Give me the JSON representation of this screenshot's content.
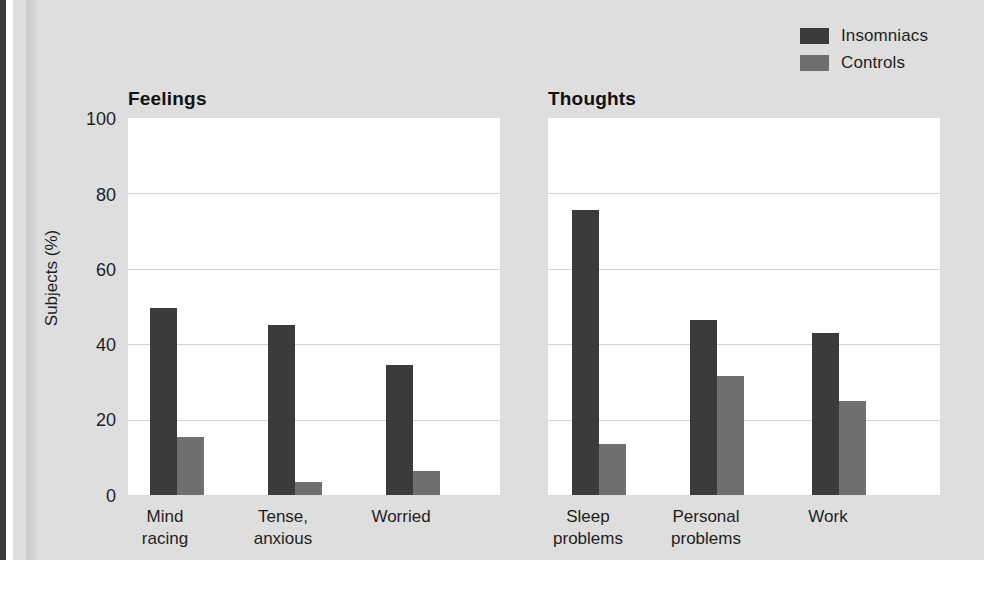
{
  "chart_data": {
    "type": "bar",
    "title": "",
    "xlabel": "",
    "ylabel": "Subjects (%)",
    "ylim": [
      0,
      100
    ],
    "yticks": [
      "0",
      "20",
      "40",
      "60",
      "80",
      "100"
    ],
    "grid": "horizontal",
    "legend_position": "top-right",
    "legend": [
      "Insomniacs",
      "Controls"
    ],
    "panels": [
      {
        "title": "Feelings",
        "categories": [
          "Mind\nracing",
          "Tense,\nanxious",
          "Worried"
        ],
        "series": [
          {
            "name": "Insomniacs",
            "color": "#3b3b3b",
            "values": [
              49.5,
              45,
              34.5
            ]
          },
          {
            "name": "Controls",
            "color": "#6f6f6f",
            "values": [
              15.5,
              3.5,
              6.5
            ]
          }
        ]
      },
      {
        "title": "Thoughts",
        "categories": [
          "Sleep\nproblems",
          "Personal\nproblems",
          "Work"
        ],
        "series": [
          {
            "name": "Insomniacs",
            "color": "#3b3b3b",
            "values": [
              75.5,
              46.5,
              43
            ]
          },
          {
            "name": "Controls",
            "color": "#6f6f6f",
            "values": [
              13.5,
              31.5,
              25
            ]
          }
        ]
      }
    ]
  },
  "legend": {
    "insomniacs_label": "Insomniacs",
    "controls_label": "Controls"
  },
  "axis": {
    "y_title": "Subjects (%)",
    "tick_100": "100",
    "tick_80": "80",
    "tick_60": "60",
    "tick_40": "40",
    "tick_20": "20",
    "tick_0": "0"
  },
  "panels": {
    "feelings": {
      "title": "Feelings",
      "cat_0": "Mind\nracing",
      "cat_1": "Tense,\nanxious",
      "cat_2": "Worried"
    },
    "thoughts": {
      "title": "Thoughts",
      "cat_0": "Sleep\nproblems",
      "cat_1": "Personal\nproblems",
      "cat_2": "Work"
    }
  },
  "colors": {
    "insomniacs": "#3b3b3b",
    "controls": "#6f6f6f",
    "panel_background": "#ffffff",
    "figure_background": "#dedede",
    "gridline": "#d2d2d2"
  }
}
